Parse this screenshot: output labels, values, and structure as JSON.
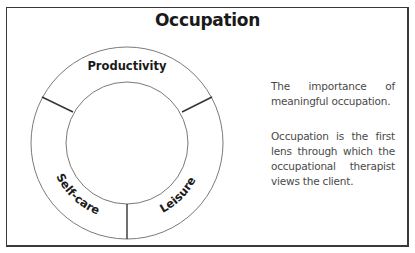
{
  "title": "Occupation",
  "diagram": {
    "segments": [
      {
        "label": "Productivity"
      },
      {
        "label": "Self-care"
      },
      {
        "label": "Leisure"
      }
    ]
  },
  "description": {
    "paragraph_1": "The importance of meaningful occupation.",
    "paragraph_2": "Occupation is the first lens through which the occupational therapist views the client."
  },
  "colors": {
    "border": "#3a3a3a",
    "ring_stroke": "#7a7a7a",
    "divider": "#333333",
    "text_dark": "#1a1a1a",
    "text_body": "#4a4a4a"
  }
}
